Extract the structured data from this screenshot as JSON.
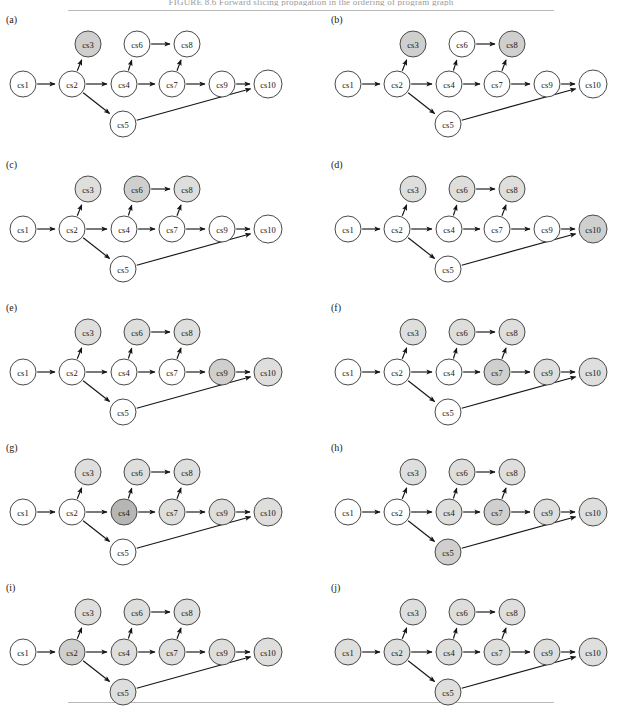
{
  "figure": {
    "top_caption": "FIGURE 8.6   Forward slicing propagation in the ordering of program graph",
    "panel_count": 10,
    "node_labels": [
      "cs1",
      "cs2",
      "cs3",
      "cs4",
      "cs5",
      "cs6",
      "cs7",
      "cs8",
      "cs9",
      "cs10"
    ],
    "colors": {
      "node_fill_plain": "#ffffff",
      "node_fill_light": "#dededd",
      "node_fill_mid": "#cfcfce",
      "node_fill_dark": "#b6b6b5",
      "node_stroke": "#4a4a4a",
      "edge_stroke": "#151515",
      "page_background": "#ffffff",
      "rule": "#b9b9b9"
    }
  },
  "graph": {
    "nodes": [
      {
        "id": "cs1",
        "label": "cs1",
        "x": 23,
        "y": 72,
        "r": 13
      },
      {
        "id": "cs2",
        "label": "cs2",
        "x": 72,
        "y": 72,
        "r": 13
      },
      {
        "id": "cs3",
        "label": "cs3",
        "x": 88,
        "y": 32,
        "r": 13
      },
      {
        "id": "cs4",
        "label": "cs4",
        "x": 124,
        "y": 72,
        "r": 13
      },
      {
        "id": "cs5",
        "label": "cs5",
        "x": 123,
        "y": 112,
        "r": 13
      },
      {
        "id": "cs6",
        "label": "cs6",
        "x": 137,
        "y": 32,
        "r": 13
      },
      {
        "id": "cs7",
        "label": "cs7",
        "x": 172,
        "y": 72,
        "r": 13
      },
      {
        "id": "cs8",
        "label": "cs8",
        "x": 187,
        "y": 32,
        "r": 13
      },
      {
        "id": "cs9",
        "label": "cs9",
        "x": 222,
        "y": 72,
        "r": 13
      },
      {
        "id": "cs10",
        "label": "cs10",
        "x": 268,
        "y": 72,
        "r": 14
      }
    ],
    "edges": [
      {
        "from": "cs1",
        "to": "cs2"
      },
      {
        "from": "cs2",
        "to": "cs3"
      },
      {
        "from": "cs2",
        "to": "cs4"
      },
      {
        "from": "cs2",
        "to": "cs5"
      },
      {
        "from": "cs4",
        "to": "cs6"
      },
      {
        "from": "cs4",
        "to": "cs7"
      },
      {
        "from": "cs6",
        "to": "cs8"
      },
      {
        "from": "cs7",
        "to": "cs8"
      },
      {
        "from": "cs7",
        "to": "cs9"
      },
      {
        "from": "cs9",
        "to": "cs10"
      },
      {
        "from": "cs5",
        "to": "cs10"
      }
    ]
  },
  "panels": [
    {
      "id": "a",
      "label": "(a)",
      "left": 0,
      "top": 12,
      "shaded": {
        "cs3": "mid"
      }
    },
    {
      "id": "b",
      "label": "(b)",
      "left": 325,
      "top": 12,
      "shaded": {
        "cs3": "mid",
        "cs8": "mid"
      }
    },
    {
      "id": "c",
      "label": "(c)",
      "left": 0,
      "top": 157,
      "shaded": {
        "cs3": "light",
        "cs6": "mid",
        "cs8": "light"
      }
    },
    {
      "id": "d",
      "label": "(d)",
      "left": 325,
      "top": 157,
      "shaded": {
        "cs3": "light",
        "cs6": "light",
        "cs8": "light",
        "cs10": "mid"
      }
    },
    {
      "id": "e",
      "label": "(e)",
      "left": 0,
      "top": 300,
      "shaded": {
        "cs3": "light",
        "cs6": "light",
        "cs8": "light",
        "cs9": "mid",
        "cs10": "light"
      }
    },
    {
      "id": "f",
      "label": "(f)",
      "left": 325,
      "top": 300,
      "shaded": {
        "cs3": "light",
        "cs6": "light",
        "cs8": "light",
        "cs7": "mid",
        "cs9": "light",
        "cs10": "light"
      }
    },
    {
      "id": "g",
      "label": "(g)",
      "left": 0,
      "top": 440,
      "shaded": {
        "cs3": "light",
        "cs6": "light",
        "cs8": "light",
        "cs4": "dark",
        "cs7": "light",
        "cs9": "light",
        "cs10": "light"
      }
    },
    {
      "id": "h",
      "label": "(h)",
      "left": 325,
      "top": 440,
      "shaded": {
        "cs3": "light",
        "cs6": "light",
        "cs8": "light",
        "cs4": "light",
        "cs7": "mid",
        "cs9": "light",
        "cs10": "light",
        "cs5": "mid"
      }
    },
    {
      "id": "i",
      "label": "(i)",
      "left": 0,
      "top": 580,
      "shaded": {
        "cs3": "light",
        "cs6": "light",
        "cs8": "light",
        "cs4": "light",
        "cs7": "light",
        "cs9": "light",
        "cs10": "light",
        "cs5": "light",
        "cs2": "mid"
      }
    },
    {
      "id": "j",
      "label": "(j)",
      "left": 325,
      "top": 580,
      "shaded": {
        "cs3": "light",
        "cs6": "light",
        "cs8": "light",
        "cs4": "light",
        "cs7": "light",
        "cs9": "light",
        "cs10": "light",
        "cs5": "light",
        "cs2": "light",
        "cs1": "light"
      }
    }
  ],
  "chart_data": {
    "type": "diagram",
    "diagram_kind": "directed-acyclic-graph-sequence",
    "node_ids": [
      "cs1",
      "cs2",
      "cs3",
      "cs4",
      "cs5",
      "cs6",
      "cs7",
      "cs8",
      "cs9",
      "cs10"
    ],
    "edge_list": [
      [
        "cs1",
        "cs2"
      ],
      [
        "cs2",
        "cs3"
      ],
      [
        "cs2",
        "cs4"
      ],
      [
        "cs2",
        "cs5"
      ],
      [
        "cs4",
        "cs6"
      ],
      [
        "cs4",
        "cs7"
      ],
      [
        "cs6",
        "cs8"
      ],
      [
        "cs7",
        "cs8"
      ],
      [
        "cs7",
        "cs9"
      ],
      [
        "cs9",
        "cs10"
      ],
      [
        "cs5",
        "cs10"
      ]
    ],
    "panels": [
      {
        "panel": "(a)",
        "highlighted_nodes": [
          "cs3"
        ]
      },
      {
        "panel": "(b)",
        "highlighted_nodes": [
          "cs3",
          "cs8"
        ]
      },
      {
        "panel": "(c)",
        "highlighted_nodes": [
          "cs3",
          "cs6",
          "cs8"
        ]
      },
      {
        "panel": "(d)",
        "highlighted_nodes": [
          "cs3",
          "cs6",
          "cs8",
          "cs10"
        ]
      },
      {
        "panel": "(e)",
        "highlighted_nodes": [
          "cs3",
          "cs6",
          "cs8",
          "cs9",
          "cs10"
        ]
      },
      {
        "panel": "(f)",
        "highlighted_nodes": [
          "cs3",
          "cs6",
          "cs7",
          "cs8",
          "cs9",
          "cs10"
        ]
      },
      {
        "panel": "(g)",
        "highlighted_nodes": [
          "cs3",
          "cs4",
          "cs6",
          "cs7",
          "cs8",
          "cs9",
          "cs10"
        ]
      },
      {
        "panel": "(h)",
        "highlighted_nodes": [
          "cs3",
          "cs4",
          "cs5",
          "cs6",
          "cs7",
          "cs8",
          "cs9",
          "cs10"
        ]
      },
      {
        "panel": "(i)",
        "highlighted_nodes": [
          "cs2",
          "cs3",
          "cs4",
          "cs5",
          "cs6",
          "cs7",
          "cs8",
          "cs9",
          "cs10"
        ]
      },
      {
        "panel": "(j)",
        "highlighted_nodes": [
          "cs1",
          "cs2",
          "cs3",
          "cs4",
          "cs5",
          "cs6",
          "cs7",
          "cs8",
          "cs9",
          "cs10"
        ]
      }
    ]
  }
}
